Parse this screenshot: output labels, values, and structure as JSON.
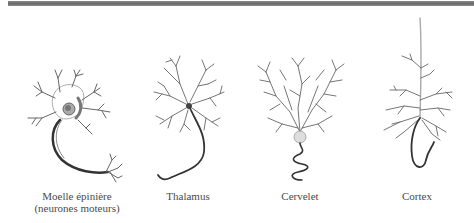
{
  "figure": {
    "neurons": [
      {
        "id": "motor",
        "label_line1": "Moelle épinière",
        "label_line2": "(neurones moteurs)"
      },
      {
        "id": "thalamus",
        "label_line1": "Thalamus"
      },
      {
        "id": "cerebellum",
        "label_line1": "Cervelet"
      },
      {
        "id": "cortex",
        "label_line1": "Cortex"
      }
    ],
    "colors": {
      "top_bar": "#777777",
      "stroke": "#555555",
      "axon": "#333333",
      "text": "#4a4a4a"
    }
  }
}
